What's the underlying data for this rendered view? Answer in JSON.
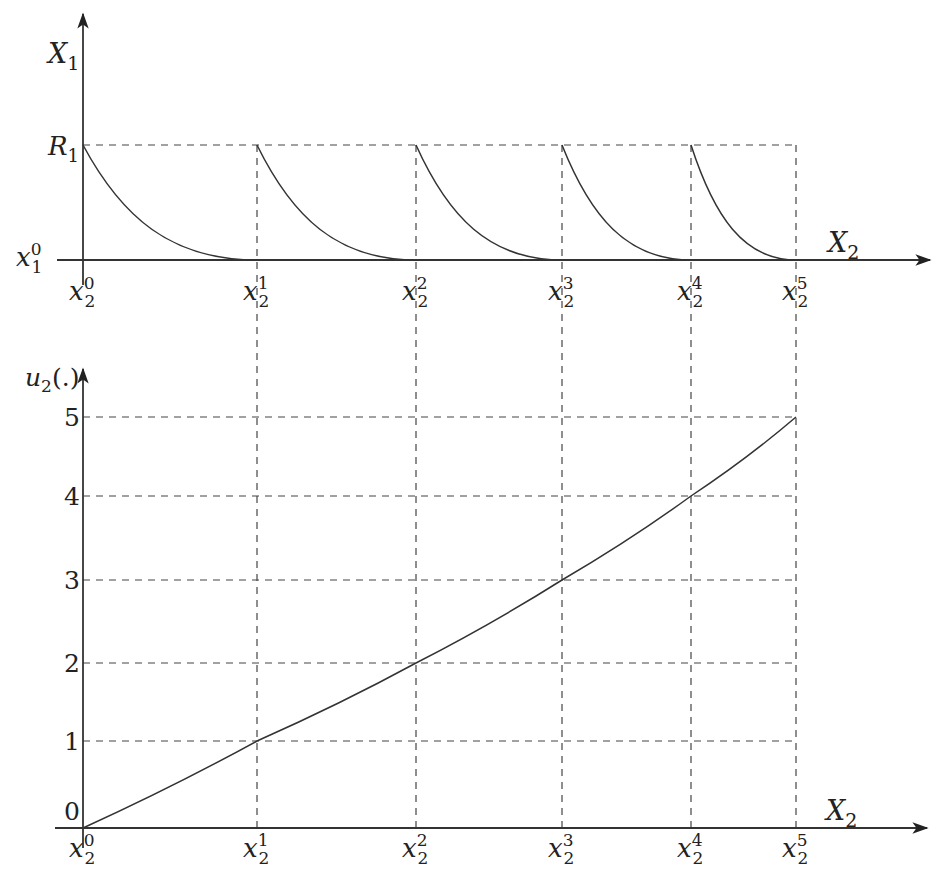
{
  "chart_data": [
    {
      "type": "line",
      "title": "",
      "xlabel": "X_2",
      "ylabel": "X_1",
      "y_ticks": [
        {
          "label": "x_1^0",
          "base": "x",
          "sub": "1",
          "sup": "0",
          "value": 0
        },
        {
          "label": "R_1",
          "base": "R",
          "sub": "1",
          "sup": "",
          "value": 1
        }
      ],
      "x_ticks": [
        {
          "label": "x_2^0",
          "base": "x",
          "sub": "2",
          "sup": "0",
          "value": 0
        },
        {
          "label": "x_2^1",
          "base": "x",
          "sub": "2",
          "sup": "1",
          "value": 1
        },
        {
          "label": "x_2^2",
          "base": "x",
          "sub": "2",
          "sup": "2",
          "value": 2
        },
        {
          "label": "x_2^3",
          "base": "x",
          "sub": "2",
          "sup": "3",
          "value": 3
        },
        {
          "label": "x_2^4",
          "base": "x",
          "sub": "2",
          "sup": "4",
          "value": 4
        },
        {
          "label": "x_2^5",
          "base": "x",
          "sub": "2",
          "sup": "5",
          "value": 5
        }
      ],
      "description": "Five convex decreasing arcs, each starting at R_1 at x_2^k and reaching x_1^0 at x_2^(k+1); segments get shorter as k increases",
      "segments": [
        {
          "from": "x_2^0",
          "to": "x_2^1",
          "start_y": "R_1",
          "end_y": "x_1^0"
        },
        {
          "from": "x_2^1",
          "to": "x_2^2",
          "start_y": "R_1",
          "end_y": "x_1^0"
        },
        {
          "from": "x_2^2",
          "to": "x_2^3",
          "start_y": "R_1",
          "end_y": "x_1^0"
        },
        {
          "from": "x_2^3",
          "to": "x_2^4",
          "start_y": "R_1",
          "end_y": "x_1^0"
        },
        {
          "from": "x_2^4",
          "to": "x_2^5",
          "start_y": "R_1",
          "end_y": "x_1^0"
        }
      ],
      "grid": "dashed lines at R_1 and at each x_2^k"
    },
    {
      "type": "line",
      "title": "",
      "xlabel": "X_2",
      "ylabel": "u_2(.)",
      "ylim": [
        0,
        5
      ],
      "y_ticks": [
        0,
        1,
        2,
        3,
        4,
        5
      ],
      "x_ticks": [
        "x_2^0",
        "x_2^1",
        "x_2^2",
        "x_2^3",
        "x_2^4",
        "x_2^5"
      ],
      "series": [
        {
          "name": "u_2(.)",
          "x": [
            "x_2^0",
            "x_2^1",
            "x_2^2",
            "x_2^3",
            "x_2^4",
            "x_2^5"
          ],
          "values": [
            0,
            1,
            2,
            3,
            4,
            5
          ]
        }
      ],
      "grid": "dashed horizontal lines at 1..5 and vertical lines at each x_2^k"
    }
  ],
  "layout": {
    "x_positions": [
      83,
      257,
      416,
      562,
      691,
      796
    ],
    "top": {
      "axis_y": 260,
      "r1_y": 145,
      "yaxis_top": 14,
      "yaxis_bottom": 285,
      "xaxis_left": 57,
      "xaxis_right": 930
    },
    "bottom": {
      "axis_y": 828,
      "yaxis_top": 369,
      "xaxis_left": 55,
      "xaxis_right": 927,
      "y_positions": [
        828,
        741,
        663,
        580,
        496,
        417
      ]
    }
  },
  "labels": {
    "top_ylabel": {
      "base": "X",
      "sub": "1"
    },
    "top_xlabel": {
      "base": "X",
      "sub": "2"
    },
    "bottom_ylabel": {
      "base": "u",
      "sub": "2",
      "rest": "(.)"
    },
    "bottom_xlabel": {
      "base": "X",
      "sub": "2"
    },
    "r1": {
      "base": "R",
      "sub": "1"
    },
    "x10": {
      "base": "x",
      "sub": "1",
      "sup": "0"
    }
  }
}
